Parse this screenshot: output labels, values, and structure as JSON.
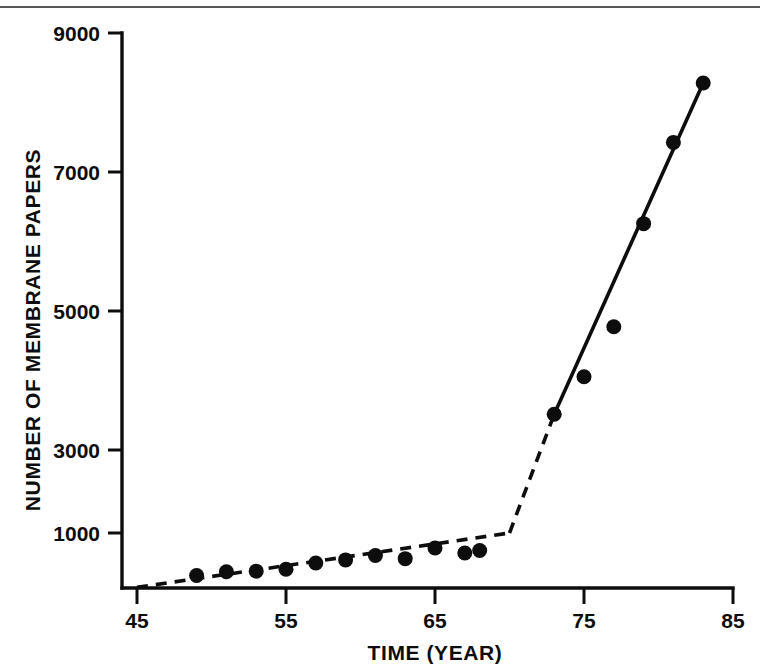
{
  "figure": {
    "background_color": "#ffffff",
    "ink_color": "#0d0d0d",
    "top_rule_color": "#3a3a3a"
  },
  "chart_data": {
    "type": "scatter",
    "title": "",
    "subtitle": "",
    "xlabel": "TIME (YEAR)",
    "ylabel": "NUMBER OF MEMBRANE PAPERS",
    "xlim": [
      45,
      85
    ],
    "ylim": [
      0,
      9000
    ],
    "xticks": [
      45,
      55,
      65,
      75,
      85
    ],
    "xtick_labels": [
      "45",
      "55",
      "65",
      "75",
      "85"
    ],
    "yticks": [
      1000,
      3000,
      5000,
      7000,
      9000
    ],
    "ytick_labels": [
      "1000",
      "3000",
      "5000",
      "7000",
      "9000"
    ],
    "grid": false,
    "legend": null,
    "legend_position": "none",
    "series": [
      {
        "name": "Number of membrane papers",
        "marker": "filled-circle",
        "marker_color": "#0d0d0d",
        "x": [
          49,
          51,
          53,
          55,
          57,
          59,
          61,
          63,
          65,
          67,
          68,
          73,
          75,
          77,
          79,
          81,
          83
        ],
        "y": [
          320,
          380,
          390,
          420,
          520,
          570,
          640,
          590,
          760,
          680,
          720,
          2900,
          3500,
          4300,
          5950,
          7250,
          8200
        ]
      }
    ],
    "trend_lines": [
      {
        "name": "early-slow-growth-trend",
        "style": "dashed",
        "x": [
          45,
          70
        ],
        "y": [
          130,
          1000
        ]
      },
      {
        "name": "late-rapid-growth-trend",
        "style": "dashed",
        "x": [
          70,
          73
        ],
        "y": [
          1000,
          2900
        ]
      },
      {
        "name": "late-rapid-growth-fit",
        "style": "solid",
        "x": [
          73,
          83
        ],
        "y": [
          2900,
          8200
        ]
      }
    ],
    "annotations": []
  },
  "axis_labels": {
    "x_title": "TIME (YEAR)",
    "y_title": "NUMBER OF MEMBRANE PAPERS"
  }
}
